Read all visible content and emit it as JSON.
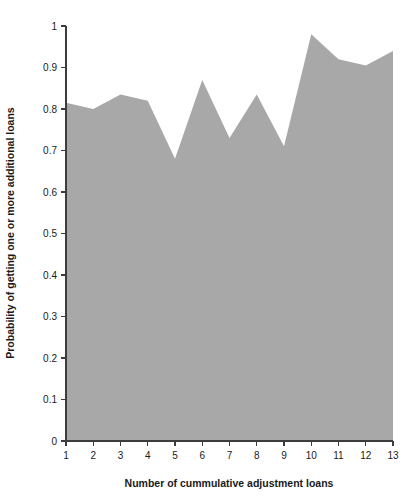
{
  "chart_data": {
    "type": "area",
    "title": "",
    "xlabel": "Number of cummulative adjustment loans",
    "ylabel": "Probability of getting one or more additional loans",
    "x": [
      1,
      2,
      3,
      4,
      5,
      6,
      7,
      8,
      9,
      10,
      11,
      12,
      13
    ],
    "values": [
      0.815,
      0.8,
      0.835,
      0.82,
      0.68,
      0.87,
      0.73,
      0.835,
      0.71,
      0.98,
      0.92,
      0.905,
      0.94
    ],
    "categories": [
      "1",
      "2",
      "3",
      "4",
      "5",
      "6",
      "7",
      "8",
      "9",
      "10",
      "11",
      "12",
      "13"
    ],
    "xtick_labels": [
      "1",
      "2",
      "3",
      "4",
      "5",
      "6",
      "7",
      "8",
      "9",
      "10",
      "11",
      "12",
      "13"
    ],
    "ytick_labels": [
      "0",
      "0.1",
      "0.2",
      "0.3",
      "0.4",
      "0.5",
      "0.6",
      "0.7",
      "0.8",
      "0.9",
      "1"
    ],
    "ytick_values": [
      0,
      0.1,
      0.2,
      0.3,
      0.4,
      0.5,
      0.6,
      0.7,
      0.8,
      0.9,
      1
    ],
    "xlim": [
      1,
      13
    ],
    "ylim": [
      0,
      1
    ],
    "grid": false,
    "legend": null,
    "fill_color": "#a8a8a8",
    "axis_color": "#3c3c3c",
    "background_color": "#ffffff"
  }
}
